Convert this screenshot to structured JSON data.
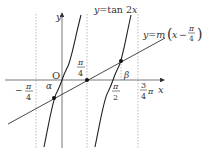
{
  "diagram": {
    "curve_label_prefix": "y=",
    "curve_label_func": "tan 2",
    "curve_label_var": "x",
    "line_label_prefix": "y=",
    "line_label_m": "m",
    "line_label_x": "x",
    "line_label_minus": "−",
    "axis_x": "x",
    "axis_y": "y",
    "origin": "O",
    "alpha": "α",
    "beta": "β",
    "pi": "π",
    "tick_neg_pi_4_minus": "−",
    "tick_pi_num": "π",
    "tick_4": "4",
    "tick_2": "2",
    "tick_3": "3",
    "colors": {
      "stroke": "#222222",
      "guide": "#999999"
    }
  }
}
